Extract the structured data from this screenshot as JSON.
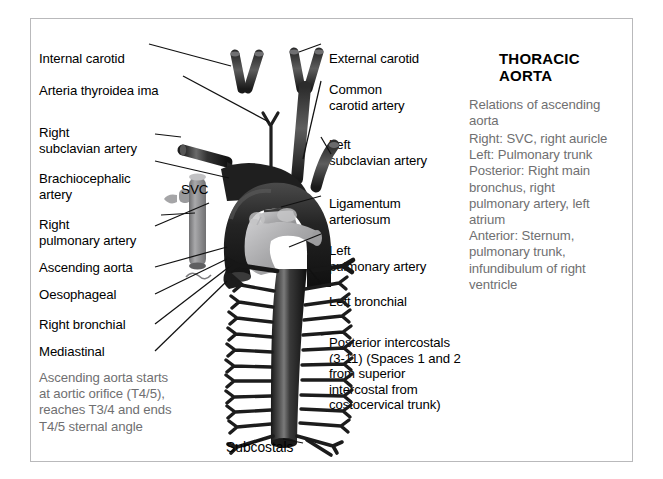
{
  "figure": {
    "title": "THORACIC AORTA",
    "labels_left": [
      {
        "id": "internal-carotid",
        "text": "Internal carotid"
      },
      {
        "id": "arteria-thyroidea",
        "text": "Arteria thyroidea ima"
      },
      {
        "id": "right-subclavian",
        "text": "Right\nsubclavian artery"
      },
      {
        "id": "brachiocephalic",
        "text": "Brachiocephalic\nartery"
      },
      {
        "id": "right-pulmonary",
        "text": "Right\npulmonary artery"
      },
      {
        "id": "ascending-aorta",
        "text": "Ascending aorta"
      },
      {
        "id": "oesophageal",
        "text": "Oesophageal"
      },
      {
        "id": "right-bronchial",
        "text": "Right bronchial"
      },
      {
        "id": "mediastinal",
        "text": "Mediastinal"
      }
    ],
    "labels_right": [
      {
        "id": "external-carotid",
        "text": "External carotid"
      },
      {
        "id": "common-carotid",
        "text": "Common\ncarotid artery"
      },
      {
        "id": "left-subclavian",
        "text": "Left\nsubclavian artery"
      },
      {
        "id": "ligamentum",
        "text": "Ligamentum\narteriosum"
      },
      {
        "id": "left-pulmonary",
        "text": "Left\npulmonary artery"
      },
      {
        "id": "left-bronchial",
        "text": "Left bronchial"
      },
      {
        "id": "posterior-intercostals",
        "text": "Posterior intercostals\n(3-11) (Spaces 1 and 2\nfrom superior\nintercostal from\ncostocervical trunk)"
      }
    ],
    "inline_labels": {
      "svc": "SVC",
      "subcostals": "Subcostals"
    },
    "note_left": "Ascending aorta starts\nat aortic orifice (T4/5),\nreaches T3/4 and ends\nT4/5 sternal angle",
    "note_right_heading": "Relations of ascending\naorta",
    "note_right_body": "Right: SVC, right auricle\nLeft: Pulmonary trunk\nPosterior: Right main\nbronchus, right\npulmonary artery, left\natrium\nAnterior: Sternum,\npulmonary trunk,\ninfundibulum of right\nventricle",
    "colors": {
      "artery_dark": "#262626",
      "artery_highlight": "#6e6e6e",
      "vein_grey": "#8e8e90",
      "pulmonary_light": "#b5b5b7",
      "note_text": "#6f6f71",
      "border": "#b9b9bb",
      "background": "#ffffff"
    }
  }
}
